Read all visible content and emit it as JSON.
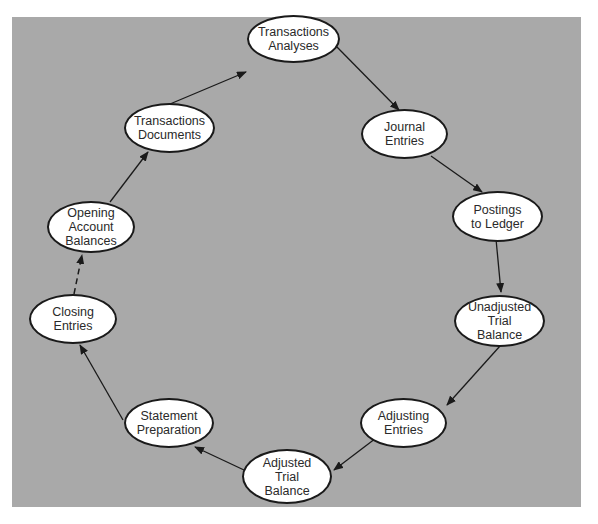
{
  "diagram": {
    "type": "cycle",
    "title": "",
    "colors": {
      "background": "#a9a9a9",
      "node_fill": "#ffffff",
      "node_border": "#1a1a1a",
      "arrow": "#1a1a1a"
    },
    "nodes": [
      {
        "id": "transactions-analyses",
        "label": "Transactions\nAnalyses"
      },
      {
        "id": "journal-entries",
        "label": "Journal\nEntries"
      },
      {
        "id": "postings-to-ledger",
        "label": "Postings\nto Ledger"
      },
      {
        "id": "unadjusted-trial-balance",
        "label": "Unadjusted\nTrial\nBalance"
      },
      {
        "id": "adjusting-entries",
        "label": "Adjusting\nEntries"
      },
      {
        "id": "adjusted-trial-balance",
        "label": "Adjusted\nTrial\nBalance"
      },
      {
        "id": "statement-preparation",
        "label": "Statement\nPreparation"
      },
      {
        "id": "closing-entries",
        "label": "Closing\nEntries"
      },
      {
        "id": "opening-account-balances",
        "label": "Opening\nAccount\nBalances"
      },
      {
        "id": "transactions-documents",
        "label": "Transactions\nDocuments"
      }
    ],
    "edges": [
      {
        "from": "transactions-analyses",
        "to": "journal-entries",
        "style": "solid"
      },
      {
        "from": "journal-entries",
        "to": "postings-to-ledger",
        "style": "solid"
      },
      {
        "from": "postings-to-ledger",
        "to": "unadjusted-trial-balance",
        "style": "solid"
      },
      {
        "from": "unadjusted-trial-balance",
        "to": "adjusting-entries",
        "style": "solid"
      },
      {
        "from": "adjusting-entries",
        "to": "adjusted-trial-balance",
        "style": "solid"
      },
      {
        "from": "adjusted-trial-balance",
        "to": "statement-preparation",
        "style": "solid"
      },
      {
        "from": "statement-preparation",
        "to": "closing-entries",
        "style": "solid"
      },
      {
        "from": "closing-entries",
        "to": "opening-account-balances",
        "style": "dashed"
      },
      {
        "from": "opening-account-balances",
        "to": "transactions-documents",
        "style": "solid"
      },
      {
        "from": "transactions-documents",
        "to": "transactions-analyses",
        "style": "solid"
      }
    ]
  }
}
